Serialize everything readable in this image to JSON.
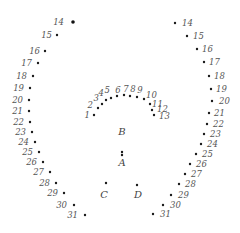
{
  "colors": {
    "dot": "#1a1a1a",
    "label": "#555555",
    "background": "#ffffff"
  },
  "inner_arc": {
    "labels": [
      "1",
      "2",
      "3",
      "4",
      "5",
      "6",
      "7",
      "8",
      "9",
      "10",
      "11",
      "12",
      "13"
    ]
  },
  "left_column": {
    "labels": [
      "14",
      "15",
      "16",
      "17",
      "18",
      "19",
      "20",
      "21",
      "22",
      "23",
      "24",
      "25",
      "26",
      "27",
      "28",
      "29",
      "30",
      "31"
    ]
  },
  "right_column": {
    "labels": [
      "14",
      "15",
      "16",
      "17",
      "18",
      "19",
      "20",
      "21",
      "22",
      "23",
      "24",
      "25",
      "26",
      "27",
      "28",
      "29",
      "30",
      "31"
    ]
  },
  "center_points": {
    "labels": [
      "B",
      "A",
      "C",
      "D"
    ]
  }
}
